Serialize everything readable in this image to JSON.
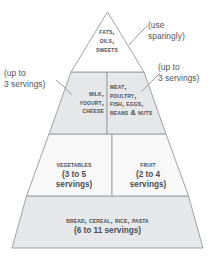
{
  "figure": {
    "name": "food-guide-pyramid",
    "colors": {
      "outline": "#9ea3a8",
      "divider": "#9ea3a8",
      "leader": "#8d9298",
      "text": "#4a4f55",
      "annotation_text": "#4f545a",
      "tier_top_fill": "#ffffff",
      "tier_second_fill": "#e6e7e8",
      "tier_third_fill": "#f7f7f7",
      "tier_base_fill": "#e6e7e8",
      "background": "#ffffff"
    }
  },
  "tiers": {
    "fats": {
      "label": "Fats,\nOils,\nSweets"
    },
    "dairy": {
      "label": "Milk,\nYogurt,\nCheese"
    },
    "protein": {
      "label": "Meat,\nPoultry,\nFish, Eggs,\nBeans & Nuts"
    },
    "vegetables": {
      "label": "Vegetables",
      "servings": "(3 to 5\nservings)"
    },
    "fruit": {
      "label": "Fruit",
      "servings": "(2 to 4\nservings)"
    },
    "grains": {
      "label": "Bread, Cereal, Rice, Pasta",
      "servings": "(6 to 11 servings)"
    }
  },
  "annotations": {
    "sparingly": "(use\nsparingly)",
    "dairy_servings": "(up to\n3 servings)",
    "protein_servings": "(up to\n3 servings)"
  }
}
